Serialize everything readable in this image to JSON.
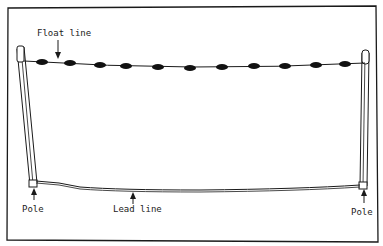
{
  "diagram": {
    "labels": {
      "float_line": "Float line",
      "lead_line": "Lead line",
      "pole_left": "Pole",
      "pole_right": "Pole"
    },
    "colors": {
      "ink": "#1a1a1a",
      "float": "#111111",
      "background": "#ffffff"
    },
    "floats": [
      {
        "x": 42,
        "y": 62
      },
      {
        "x": 70,
        "y": 63
      },
      {
        "x": 100,
        "y": 65
      },
      {
        "x": 126,
        "y": 66
      },
      {
        "x": 158,
        "y": 67
      },
      {
        "x": 190,
        "y": 68
      },
      {
        "x": 222,
        "y": 67
      },
      {
        "x": 254,
        "y": 66
      },
      {
        "x": 285,
        "y": 66
      },
      {
        "x": 316,
        "y": 65
      },
      {
        "x": 345,
        "y": 64
      }
    ]
  }
}
